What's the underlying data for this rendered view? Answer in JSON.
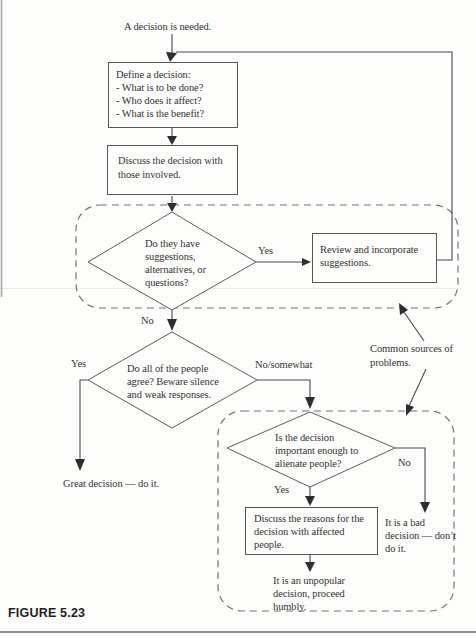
{
  "figure": {
    "caption": "FIGURE 5.23"
  },
  "nodes": {
    "start": "A decision is needed.",
    "define": {
      "lines": [
        "Define a decision:",
        "- What is to be done?",
        "- Who does it affect?",
        "- What is the benefit?"
      ]
    },
    "discuss": {
      "lines": [
        "Discuss the decision with",
        "those involved."
      ]
    },
    "suggestions_diamond": {
      "lines": [
        "Do they have",
        "suggestions,",
        "alternatives, or",
        "questions?"
      ]
    },
    "review": {
      "lines": [
        "Review and incorporate",
        "suggestions."
      ]
    },
    "agree_diamond": {
      "lines": [
        "Do all of the people",
        "agree? Beware silence",
        "and weak responses."
      ]
    },
    "great": "Great decision — do it.",
    "alienate_diamond": {
      "lines": [
        "Is the decision",
        "important enough to",
        "alienate people?"
      ]
    },
    "reasons": {
      "lines": [
        "Discuss the reasons for the",
        "decision with affected",
        "people."
      ]
    },
    "bad": {
      "lines": [
        "It is a bad",
        "decision — don’t",
        "do it."
      ]
    },
    "unpopular": {
      "lines": [
        "It is an unpopular",
        "decision, proceed",
        "humbly."
      ]
    },
    "common_sources": {
      "lines": [
        "Common sources of",
        "problems."
      ]
    }
  },
  "edge_labels": {
    "yes1": "Yes",
    "no1": "No",
    "yes2": "Yes",
    "no_somewhat": "No/somewhat",
    "yes3": "Yes",
    "no3": "No"
  },
  "colors": {
    "ink": "#4a4a4a",
    "text": "#333333",
    "dashed_border": "#737373"
  }
}
